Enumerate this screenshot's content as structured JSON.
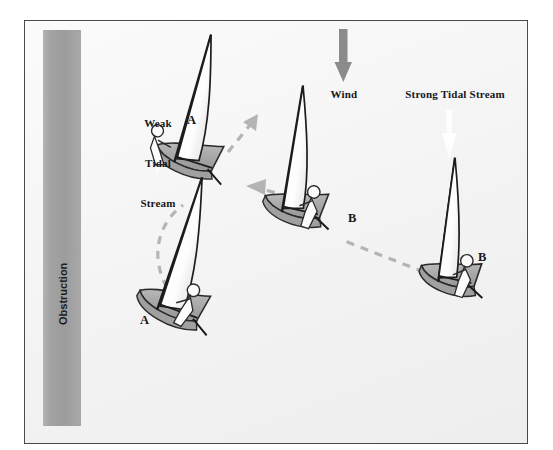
{
  "diagram": {
    "background_color": "#f4f4f4",
    "frame_border_color": "#4a4a4a"
  },
  "obstruction": {
    "label": "Obstruction",
    "fill_color": "#9d9d9d"
  },
  "wind": {
    "label": "Wind",
    "arrow_color": "#8c8c8c",
    "direction": "down"
  },
  "tidal_streams": [
    {
      "id": "weak",
      "label": "Weak\nTidal\nStream",
      "label_lines": [
        "Weak",
        "Tidal",
        "Stream"
      ],
      "arrow_color": "#ffffff",
      "direction": "down",
      "strength": "weak"
    },
    {
      "id": "strong",
      "label": "Strong Tidal Stream",
      "arrow_color": "#ffffff",
      "direction": "down",
      "strength": "strong"
    }
  ],
  "boats": [
    {
      "id": "a-upper",
      "label": "A",
      "hull_color": "#b0b0b0",
      "sail_color": "#ffffff"
    },
    {
      "id": "a-lower",
      "label": "A",
      "hull_color": "#b0b0b0",
      "sail_color": "#ffffff"
    },
    {
      "id": "b-middle",
      "label": "B",
      "hull_color": "#b0b0b0",
      "sail_color": "#ffffff"
    },
    {
      "id": "b-right",
      "label": "B",
      "hull_color": "#b0b0b0",
      "sail_color": "#ffffff"
    }
  ],
  "tracks": {
    "dash_color": "#b3b3b3",
    "paths": [
      {
        "id": "track-a",
        "description": "curved dashed path for boat A heading up-right"
      },
      {
        "id": "track-b",
        "description": "dashed path for boat B heading left"
      }
    ]
  }
}
